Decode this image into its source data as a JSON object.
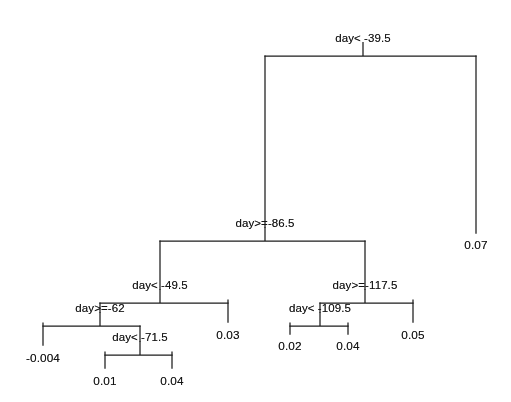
{
  "figure": {
    "kind": "decision-tree",
    "variable": "day",
    "background_color": "#ffffff",
    "line_color": "#1c1c1c",
    "text_color": "#141414"
  },
  "tree": {
    "splits": [
      {
        "id": "root",
        "label": "day< -39.5",
        "x": 363,
        "y": 41,
        "bar_left": 265,
        "bar_right": 476
      },
      {
        "id": "n2",
        "label": "day>=-86.5",
        "x": 265,
        "y": 226,
        "bar_left": 160,
        "bar_right": 365
      },
      {
        "id": "n4",
        "label": "day< -49.5",
        "x": 160,
        "y": 288,
        "bar_left": 100,
        "bar_right": 228
      },
      {
        "id": "n8",
        "label": "day>=-62",
        "x": 100,
        "y": 311,
        "bar_left": 43,
        "bar_right": 140
      },
      {
        "id": "n17",
        "label": "day< -71.5",
        "x": 140,
        "y": 340,
        "bar_left": 105,
        "bar_right": 172
      },
      {
        "id": "n5",
        "label": "day>=-117.5",
        "x": 365,
        "y": 288,
        "bar_left": 320,
        "bar_right": 413
      },
      {
        "id": "n10",
        "label": "day< -109.5",
        "x": 320,
        "y": 311,
        "bar_left": 290,
        "bar_right": 348
      }
    ],
    "leaves": [
      {
        "id": "l_0_07",
        "label": "0.07",
        "x": 476,
        "y": 244,
        "stem_top": 56,
        "stem_bottom": 233
      },
      {
        "id": "l_0_03",
        "label": "0.03",
        "x": 228,
        "y": 334,
        "stem_top": 300,
        "stem_bottom": 322
      },
      {
        "id": "l_m0004",
        "label": "-0.004",
        "x": 43,
        "y": 357,
        "stem_top": 323,
        "stem_bottom": 345
      },
      {
        "id": "l_0_01",
        "label": "0.01",
        "x": 105,
        "y": 380,
        "stem_top": 352,
        "stem_bottom": 368
      },
      {
        "id": "l_0_04a",
        "label": "0.04",
        "x": 172,
        "y": 380,
        "stem_top": 352,
        "stem_bottom": 368
      },
      {
        "id": "l_0_02",
        "label": "0.02",
        "x": 290,
        "y": 345,
        "stem_top": 323,
        "stem_bottom": 334
      },
      {
        "id": "l_0_04b",
        "label": "0.04",
        "x": 348,
        "y": 345,
        "stem_top": 323,
        "stem_bottom": 334
      },
      {
        "id": "l_0_05",
        "label": "0.05",
        "x": 413,
        "y": 334,
        "stem_top": 300,
        "stem_bottom": 322
      }
    ]
  },
  "chart_data": {
    "type": "tree",
    "title": "",
    "xlabel": "",
    "ylabel": "",
    "split_variable": "day",
    "nodes": [
      {
        "node": 1,
        "depth": 0,
        "type": "split",
        "rule": "day< -39.5",
        "yes_child": 2,
        "no_child": "leaf_0.07"
      },
      {
        "node": 2,
        "depth": 1,
        "type": "split",
        "rule": "day>=-86.5",
        "yes_child": 4,
        "no_child": 5
      },
      {
        "node": 4,
        "depth": 2,
        "type": "split",
        "rule": "day< -49.5",
        "yes_child": 8,
        "no_child": "leaf_0.03"
      },
      {
        "node": 8,
        "depth": 3,
        "type": "split",
        "rule": "day>=-62",
        "yes_child": "leaf_-0.004",
        "no_child": 17
      },
      {
        "node": 17,
        "depth": 4,
        "type": "split",
        "rule": "day< -71.5",
        "yes_child": "leaf_0.01",
        "no_child": "leaf_0.04"
      },
      {
        "node": 5,
        "depth": 2,
        "type": "split",
        "rule": "day>=-117.5",
        "yes_child": 10,
        "no_child": "leaf_0.05"
      },
      {
        "node": 10,
        "depth": 3,
        "type": "split",
        "rule": "day< -109.5",
        "yes_child": "leaf_0.02",
        "no_child": "leaf_0.04"
      }
    ],
    "leaf_values": [
      0.07,
      0.03,
      -0.004,
      0.01,
      0.04,
      0.02,
      0.04,
      0.05
    ],
    "leaf_order_left_to_right": [
      -0.004,
      0.01,
      0.04,
      0.03,
      0.02,
      0.04,
      0.05,
      0.07
    ],
    "n_leaves": 8,
    "grid": false,
    "legend": false
  }
}
